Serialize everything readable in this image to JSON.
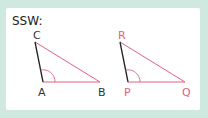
{
  "title": "SSW:",
  "colors": {
    "background": "#cfe9e0",
    "card": "#ffffff",
    "accent": "#e0607e",
    "line_dark": "#222222"
  },
  "triangle1": {
    "labels": {
      "top": "C",
      "bottom_left": "A",
      "bottom_right": "B"
    },
    "label_color": "#333333"
  },
  "triangle2": {
    "labels": {
      "top": "R",
      "bottom_left": "P",
      "bottom_right": "Q"
    },
    "label_color": "#e0607e"
  }
}
